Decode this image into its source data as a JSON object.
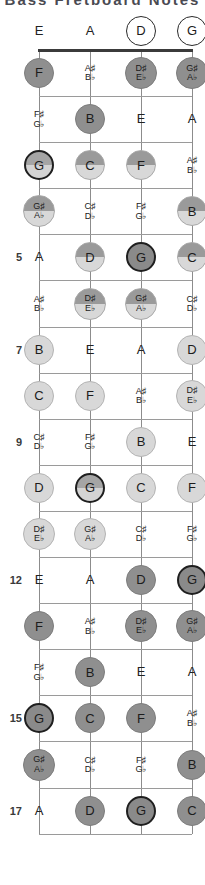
{
  "title": "Bass Fretboard Notes",
  "instrument": {
    "strings": [
      "E",
      "A",
      "D",
      "G"
    ],
    "string_count": 4,
    "fret_count": 17
  },
  "legend": {
    "root_note": "G",
    "root_color": "#1f1f1f",
    "natural_fill": "#d8d8d8",
    "accidental_fill": "#9a9a9a",
    "open_fill": "#ffffff"
  },
  "fret_markers": [
    "5",
    "7",
    "9",
    "12",
    "15",
    "17"
  ],
  "chart_data": {
    "type": "table",
    "title": "Bass Fretboard Notes",
    "xlabel": "String",
    "ylabel": "Fret",
    "categories": [
      "E",
      "A",
      "D",
      "G"
    ],
    "rows": [
      {
        "fret": "0",
        "label": "",
        "notes": [
          {
            "name": "E",
            "style": "plain"
          },
          {
            "name": "A",
            "style": "plain"
          },
          {
            "name": "D",
            "style": "open"
          },
          {
            "name": "G",
            "style": "open"
          }
        ]
      },
      {
        "fret": "1",
        "label": "",
        "notes": [
          {
            "name": "F",
            "style": "dark"
          },
          {
            "name": "A♯|B♭",
            "style": "plain-acc"
          },
          {
            "name": "D♯|E♭",
            "style": "dark-acc"
          },
          {
            "name": "G♯|A♭",
            "style": "dark-acc"
          }
        ]
      },
      {
        "fret": "2",
        "label": "",
        "notes": [
          {
            "name": "F♯|G♭",
            "style": "plain-acc"
          },
          {
            "name": "B",
            "style": "dark"
          },
          {
            "name": "E",
            "style": "plain"
          },
          {
            "name": "A",
            "style": "plain"
          }
        ]
      },
      {
        "fret": "3",
        "label": "",
        "notes": [
          {
            "name": "G",
            "style": "root"
          },
          {
            "name": "C",
            "style": "split"
          },
          {
            "name": "F",
            "style": "split"
          },
          {
            "name": "A♯|B♭",
            "style": "plain-acc"
          }
        ]
      },
      {
        "fret": "4",
        "label": "",
        "notes": [
          {
            "name": "G♯|A♭",
            "style": "split-acc"
          },
          {
            "name": "C♯|D♭",
            "style": "plain-acc"
          },
          {
            "name": "F♯|G♭",
            "style": "plain-acc"
          },
          {
            "name": "B",
            "style": "split"
          }
        ]
      },
      {
        "fret": "5",
        "label": "5",
        "notes": [
          {
            "name": "A",
            "style": "plain"
          },
          {
            "name": "D",
            "style": "split"
          },
          {
            "name": "G",
            "style": "rootd"
          },
          {
            "name": "C",
            "style": "split"
          }
        ]
      },
      {
        "fret": "6",
        "label": "",
        "notes": [
          {
            "name": "A♯|B♭",
            "style": "plain-acc"
          },
          {
            "name": "D♯|E♭",
            "style": "split-acc"
          },
          {
            "name": "G♯|A♭",
            "style": "split-acc"
          },
          {
            "name": "C♯|D♭",
            "style": "plain-acc"
          }
        ]
      },
      {
        "fret": "7",
        "label": "7",
        "notes": [
          {
            "name": "B",
            "style": "light"
          },
          {
            "name": "E",
            "style": "plain"
          },
          {
            "name": "A",
            "style": "plain"
          },
          {
            "name": "D",
            "style": "light"
          }
        ]
      },
      {
        "fret": "8",
        "label": "",
        "notes": [
          {
            "name": "C",
            "style": "light"
          },
          {
            "name": "F",
            "style": "light"
          },
          {
            "name": "A♯|B♭",
            "style": "plain-acc"
          },
          {
            "name": "D♯|E♭",
            "style": "light-acc"
          }
        ]
      },
      {
        "fret": "9",
        "label": "9",
        "notes": [
          {
            "name": "C♯|D♭",
            "style": "plain-acc"
          },
          {
            "name": "F♯|G♭",
            "style": "plain-acc"
          },
          {
            "name": "B",
            "style": "light"
          },
          {
            "name": "E",
            "style": "plain"
          }
        ]
      },
      {
        "fret": "10",
        "label": "",
        "notes": [
          {
            "name": "D",
            "style": "light"
          },
          {
            "name": "G",
            "style": "root"
          },
          {
            "name": "C",
            "style": "light"
          },
          {
            "name": "F",
            "style": "light"
          }
        ]
      },
      {
        "fret": "11",
        "label": "",
        "notes": [
          {
            "name": "D♯|E♭",
            "style": "light-acc"
          },
          {
            "name": "G♯|A♭",
            "style": "light-acc"
          },
          {
            "name": "C♯|D♭",
            "style": "plain-acc"
          },
          {
            "name": "F♯|G♭",
            "style": "plain-acc"
          }
        ]
      },
      {
        "fret": "12",
        "label": "12",
        "notes": [
          {
            "name": "E",
            "style": "plain"
          },
          {
            "name": "A",
            "style": "plain"
          },
          {
            "name": "D",
            "style": "dark"
          },
          {
            "name": "G",
            "style": "rootd"
          }
        ]
      },
      {
        "fret": "13",
        "label": "",
        "notes": [
          {
            "name": "F",
            "style": "dark"
          },
          {
            "name": "A♯|B♭",
            "style": "plain-acc"
          },
          {
            "name": "D♯|E♭",
            "style": "dark-acc"
          },
          {
            "name": "G♯|A♭",
            "style": "dark-acc"
          }
        ]
      },
      {
        "fret": "14",
        "label": "",
        "notes": [
          {
            "name": "F♯|G♭",
            "style": "plain-acc"
          },
          {
            "name": "B",
            "style": "dark"
          },
          {
            "name": "E",
            "style": "plain"
          },
          {
            "name": "A",
            "style": "plain"
          }
        ]
      },
      {
        "fret": "15",
        "label": "15",
        "notes": [
          {
            "name": "G",
            "style": "rootd"
          },
          {
            "name": "C",
            "style": "dark"
          },
          {
            "name": "F",
            "style": "dark"
          },
          {
            "name": "A♯|B♭",
            "style": "plain-acc"
          }
        ]
      },
      {
        "fret": "16",
        "label": "",
        "notes": [
          {
            "name": "G♯|A♭",
            "style": "dark-acc"
          },
          {
            "name": "C♯|D♭",
            "style": "plain-acc"
          },
          {
            "name": "F♯|G♭",
            "style": "plain-acc"
          },
          {
            "name": "B",
            "style": "dark"
          }
        ]
      },
      {
        "fret": "17",
        "label": "17",
        "notes": [
          {
            "name": "A",
            "style": "plain"
          },
          {
            "name": "D",
            "style": "dark"
          },
          {
            "name": "G",
            "style": "rootd"
          },
          {
            "name": "C",
            "style": "dark"
          }
        ]
      }
    ]
  }
}
